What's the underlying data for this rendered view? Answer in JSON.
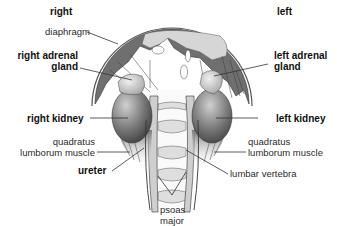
{
  "diagram": {
    "orientation": {
      "right": "right",
      "left": "left"
    },
    "labels": {
      "diaphragm": "diaphragm",
      "right_adrenal_gland_1": "right adrenal",
      "right_adrenal_gland_2": "gland",
      "left_adrenal_gland_1": "left adrenal",
      "left_adrenal_gland_2": "gland",
      "right_kidney": "right kidney",
      "left_kidney": "left kidney",
      "right_quadratus_1": "quadratus",
      "right_quadratus_2": "lumborum muscle",
      "left_quadratus_1": "quadratus",
      "left_quadratus_2": "lumborum muscle",
      "ureter": "ureter",
      "lumbar_vertebra": "lumbar vertebra",
      "psoas_1": "psoas",
      "psoas_2": "major"
    },
    "colors": {
      "muscle_dark": "#6e6e6e",
      "dome_light": "#d6d6d6",
      "kidney_dark": "#4a4a4a",
      "kidney_light": "#bdbdbd",
      "line": "#333333"
    }
  }
}
